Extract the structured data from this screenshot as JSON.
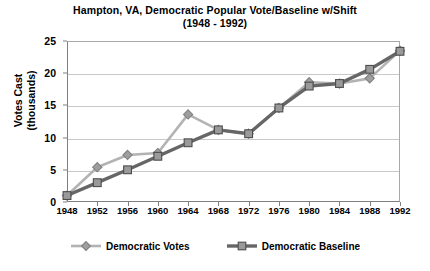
{
  "chart_data": {
    "type": "line",
    "title": "Hampton, VA, Democratic Popular Vote/Baseline w/Shift",
    "subtitle": "(1948 - 1992)",
    "xlabel": "",
    "ylabel": "Votes Cast (thousands)",
    "ylabel_line1": "Votes Cast",
    "ylabel_line2": "(thousands)",
    "categories": [
      "1948",
      "1952",
      "1956",
      "1960",
      "1964",
      "1968",
      "1972",
      "1976",
      "1980",
      "1984",
      "1988",
      "1992"
    ],
    "x": [
      1948,
      1952,
      1956,
      1960,
      1964,
      1968,
      1972,
      1976,
      1980,
      1984,
      1988,
      1992
    ],
    "ylim": [
      0,
      25
    ],
    "yticks": [
      0,
      5,
      10,
      15,
      20,
      25
    ],
    "grid": true,
    "legend_position": "bottom",
    "series": [
      {
        "name": "Democratic Votes",
        "marker": "diamond",
        "color": "#b3b3b3",
        "values": [
          1.0,
          5.4,
          7.3,
          7.6,
          13.6,
          11.2,
          10.6,
          14.6,
          18.6,
          18.4,
          19.2,
          23.5
        ]
      },
      {
        "name": "Democratic Baseline",
        "marker": "square",
        "color": "#666666",
        "values": [
          1.0,
          3.0,
          5.0,
          7.1,
          9.2,
          11.2,
          10.6,
          14.6,
          18.0,
          18.4,
          20.6,
          23.4
        ]
      }
    ]
  },
  "legend": {
    "items": [
      {
        "label": "Democratic Votes"
      },
      {
        "label": "Democratic Baseline"
      }
    ]
  }
}
